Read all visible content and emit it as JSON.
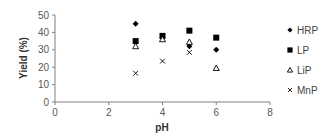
{
  "chart_data": {
    "type": "scatter",
    "title": "",
    "xlabel": "pH",
    "ylabel": "Yield (%)",
    "xlim": [
      0,
      8
    ],
    "ylim": [
      0,
      50
    ],
    "xticks": [
      0,
      2,
      4,
      6,
      8
    ],
    "yticks": [
      0,
      10,
      20,
      30,
      40,
      50
    ],
    "grid": false,
    "legend_position": "right",
    "x": [
      3,
      4,
      5,
      6
    ],
    "series": [
      {
        "name": "HRP",
        "marker": "diamond",
        "values": [
          45,
          37,
          32,
          30
        ]
      },
      {
        "name": "LP",
        "marker": "square",
        "values": [
          35,
          38,
          41,
          37
        ]
      },
      {
        "name": "LiP",
        "marker": "triangle-open",
        "values": [
          32,
          36,
          34.5,
          19.5
        ]
      },
      {
        "name": "MnP",
        "marker": "x",
        "values": [
          16.5,
          23.5,
          28.5,
          null
        ]
      }
    ]
  },
  "axes": {
    "x_title": "pH",
    "y_title": "Yield (%)",
    "x_tick_labels": [
      "0",
      "2",
      "4",
      "6",
      "8"
    ],
    "y_tick_labels": [
      "0",
      "10",
      "20",
      "30",
      "40",
      "50"
    ]
  },
  "legend": {
    "items": [
      {
        "label": "HRP",
        "marker": "diamond"
      },
      {
        "label": "LP",
        "marker": "square"
      },
      {
        "label": "LiP",
        "marker": "triangle-open"
      },
      {
        "label": "MnP",
        "marker": "x"
      }
    ]
  },
  "colors": {
    "axis": "#808080",
    "marker": "#000000"
  }
}
